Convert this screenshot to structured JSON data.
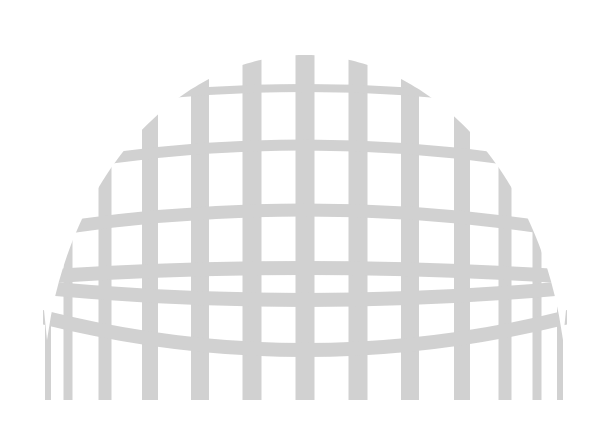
{
  "graphic": {
    "name": "grid-dome",
    "color": "#c9c9c9",
    "background": "#ffffff",
    "vertical_bars_x": [
      48,
      68,
      105,
      150,
      200,
      252,
      305,
      358,
      410,
      462,
      505,
      537,
      560
    ],
    "vertical_bar_widths": [
      6,
      9,
      13,
      16,
      18,
      19,
      19,
      19,
      18,
      16,
      13,
      9,
      6
    ],
    "bottom_y": 400,
    "horizontal_bands": 7
  }
}
